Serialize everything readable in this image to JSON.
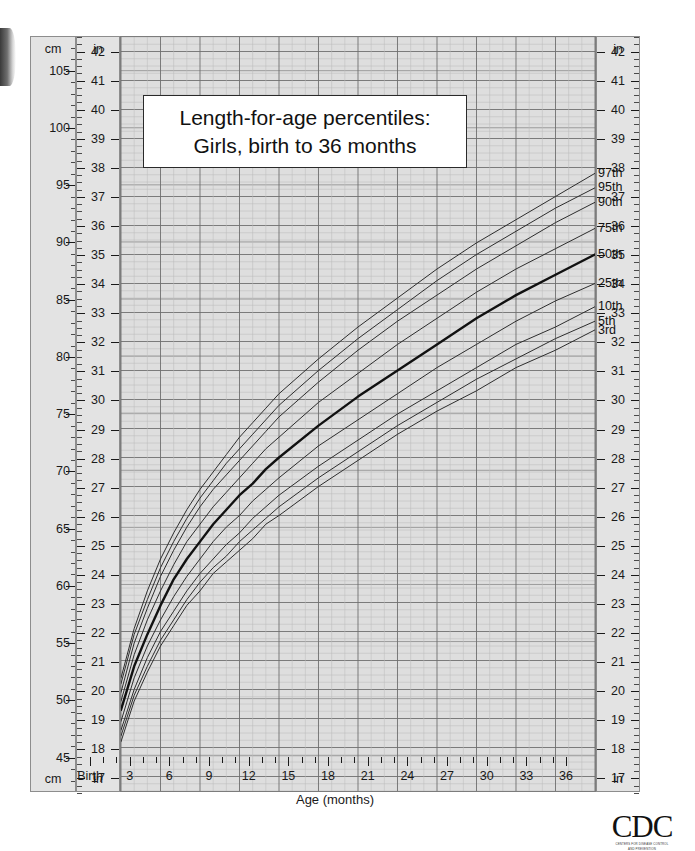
{
  "title": {
    "line1": "Length-for-age percentiles:",
    "line2": "Girls, birth to 36 months"
  },
  "axes": {
    "cm_header_top": "cm",
    "cm_header_bottom": "cm",
    "in_header_top": "in",
    "in_header_bottom": "in",
    "x_title": "Age (months)",
    "x_birth_label": "Birth"
  },
  "logo": {
    "wordmark": "CDC",
    "subtext_line1": "CENTERS FOR DISEASE CONTROL",
    "subtext_line2": "AND PREVENTION"
  },
  "chart_data": {
    "type": "line",
    "title": "Length-for-age percentiles: Girls, birth to 36 months",
    "xlabel": "Age (months)",
    "ylabel": "Length (in / cm)",
    "xlim": [
      0,
      36
    ],
    "ylim_in": [
      16.5,
      42.5
    ],
    "ylim_cm": [
      41.9,
      107.9
    ],
    "grid": true,
    "legend": "inline-right-of-curve-ends",
    "x_ticks": [
      "Birth",
      "3",
      "6",
      "9",
      "12",
      "15",
      "18",
      "21",
      "24",
      "27",
      "30",
      "33",
      "36"
    ],
    "x_tick_values": [
      0,
      3,
      6,
      9,
      12,
      15,
      18,
      21,
      24,
      27,
      30,
      33,
      36
    ],
    "x_minor_tick_interval_months": 1,
    "y_ticks_in": [
      17,
      18,
      19,
      20,
      21,
      22,
      23,
      24,
      25,
      26,
      27,
      28,
      29,
      30,
      31,
      32,
      33,
      34,
      35,
      36,
      37,
      38,
      39,
      40,
      41,
      42
    ],
    "y_ticks_cm": [
      45,
      50,
      55,
      60,
      65,
      70,
      75,
      80,
      85,
      90,
      95,
      100,
      105
    ],
    "x": [
      0,
      1,
      2,
      3,
      4,
      5,
      6,
      7,
      8,
      9,
      10,
      11,
      12,
      15,
      18,
      21,
      24,
      27,
      30,
      33,
      36
    ],
    "units": "inches",
    "series": [
      {
        "name": "97th",
        "label": "97th",
        "values": [
          20.4,
          22.1,
          23.4,
          24.5,
          25.4,
          26.2,
          26.9,
          27.5,
          28.1,
          28.7,
          29.2,
          29.7,
          30.2,
          31.4,
          32.5,
          33.5,
          34.5,
          35.4,
          36.2,
          37.0,
          37.8
        ],
        "color": "#2c2c2c",
        "width": 1
      },
      {
        "name": "95th",
        "label": "95th",
        "values": [
          20.2,
          21.9,
          23.1,
          24.2,
          25.1,
          25.9,
          26.6,
          27.2,
          27.8,
          28.3,
          28.8,
          29.3,
          29.8,
          31.0,
          32.1,
          33.1,
          34.1,
          35.0,
          35.8,
          36.6,
          37.3
        ],
        "color": "#2c2c2c",
        "width": 1
      },
      {
        "name": "90th",
        "label": "90th",
        "values": [
          19.9,
          21.6,
          22.8,
          23.9,
          24.8,
          25.6,
          26.3,
          26.9,
          27.4,
          27.9,
          28.4,
          28.9,
          29.4,
          30.6,
          31.7,
          32.7,
          33.6,
          34.5,
          35.3,
          36.1,
          36.8
        ],
        "color": "#2c2c2c",
        "width": 1
      },
      {
        "name": "75th",
        "label": "75th",
        "values": [
          19.6,
          21.2,
          22.4,
          23.4,
          24.3,
          25.1,
          25.7,
          26.3,
          26.8,
          27.3,
          27.8,
          28.3,
          28.7,
          29.9,
          30.9,
          31.9,
          32.8,
          33.7,
          34.5,
          35.2,
          35.9
        ],
        "color": "#2c2c2c",
        "width": 1
      },
      {
        "name": "50th",
        "label": "50th",
        "values": [
          19.3,
          20.8,
          21.9,
          22.9,
          23.8,
          24.5,
          25.1,
          25.7,
          26.2,
          26.7,
          27.1,
          27.6,
          28.0,
          29.1,
          30.1,
          31.0,
          31.9,
          32.8,
          33.6,
          34.3,
          35.0
        ],
        "color": "#111111",
        "width": 2.4
      },
      {
        "name": "25th",
        "label": "25th",
        "values": [
          18.9,
          20.4,
          21.5,
          22.4,
          23.2,
          23.9,
          24.5,
          25.1,
          25.6,
          26.0,
          26.5,
          26.9,
          27.3,
          28.4,
          29.3,
          30.2,
          31.1,
          31.9,
          32.7,
          33.4,
          34.0
        ],
        "color": "#2c2c2c",
        "width": 1
      },
      {
        "name": "10th",
        "label": "10th",
        "values": [
          18.6,
          20.0,
          21.1,
          22.0,
          22.7,
          23.4,
          24.0,
          24.5,
          25.0,
          25.4,
          25.9,
          26.3,
          26.7,
          27.7,
          28.6,
          29.5,
          30.3,
          31.1,
          31.9,
          32.5,
          33.2
        ],
        "color": "#2c2c2c",
        "width": 1
      },
      {
        "name": "5th",
        "label": "5th",
        "values": [
          18.4,
          19.8,
          20.8,
          21.7,
          22.4,
          23.1,
          23.7,
          24.2,
          24.6,
          25.1,
          25.5,
          25.9,
          26.3,
          27.3,
          28.2,
          29.1,
          29.9,
          30.7,
          31.4,
          32.1,
          32.7
        ],
        "color": "#2c2c2c",
        "width": 1
      },
      {
        "name": "3rd",
        "label": "3rd",
        "values": [
          18.2,
          19.6,
          20.6,
          21.5,
          22.2,
          22.9,
          23.4,
          24.0,
          24.4,
          24.8,
          25.2,
          25.7,
          26.0,
          27.0,
          27.9,
          28.8,
          29.6,
          30.3,
          31.1,
          31.7,
          32.4
        ],
        "color": "#2c2c2c",
        "width": 1
      }
    ]
  }
}
